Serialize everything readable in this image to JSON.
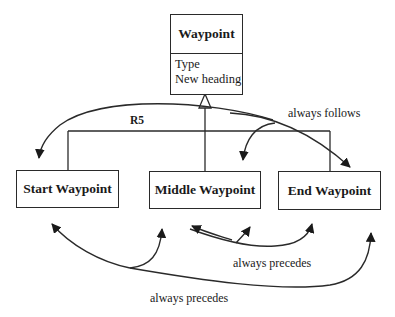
{
  "diagram": {
    "superclass": {
      "name": "Waypoint",
      "attributes": [
        "Type",
        "New heading"
      ]
    },
    "generalization_label": "R5",
    "subclasses": [
      {
        "name": "Start Waypoint"
      },
      {
        "name": "Middle Waypoint"
      },
      {
        "name": "End Waypoint"
      }
    ],
    "relations": [
      {
        "label": "always follows",
        "from": "Waypoint",
        "to": [
          "Start Waypoint",
          "Middle Waypoint",
          "End Waypoint"
        ]
      },
      {
        "label": "always precedes",
        "from": "Middle Waypoint",
        "to": [
          "Middle Waypoint",
          "End Waypoint"
        ]
      },
      {
        "label": "always precedes",
        "from": "Start Waypoint",
        "to": [
          "Start Waypoint",
          "Middle Waypoint",
          "End Waypoint"
        ]
      }
    ]
  }
}
